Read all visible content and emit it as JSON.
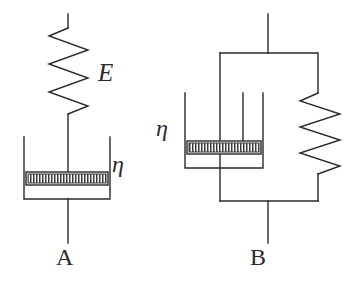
{
  "figure": {
    "background_color": "#ffffff",
    "stroke_color": "#2a2a2a",
    "width": 359,
    "height": 286
  },
  "models": {
    "a": {
      "caption": "A",
      "arrangement": "series",
      "spring_label": "E",
      "dashpot_label": "η",
      "components": [
        {
          "type": "spring",
          "label": "E",
          "coils": 5
        },
        {
          "type": "dashpot",
          "label": "η"
        }
      ]
    },
    "b": {
      "caption": "B",
      "arrangement": "parallel",
      "spring_label": "",
      "dashpot_label": "η",
      "components": [
        {
          "type": "dashpot",
          "label": "η"
        },
        {
          "type": "spring",
          "label": "",
          "coils": 4
        }
      ]
    }
  },
  "labels": {
    "spring_modulus": "E",
    "viscosity_a": "η",
    "viscosity_b": "η",
    "caption_a": "A",
    "caption_b": "B"
  }
}
